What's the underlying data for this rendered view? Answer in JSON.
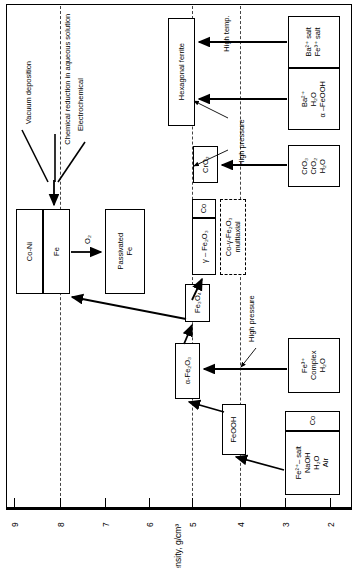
{
  "figure": {
    "axis_title": "Bulk density, g/cm³",
    "tick_labels": [
      "9",
      "8",
      "7",
      "6",
      "5",
      "4",
      "3",
      "2"
    ],
    "dashed_guides": [
      "8",
      "5",
      "4"
    ]
  },
  "process_labels": {
    "vacuum_deposition": "Vacuum deposition",
    "chemical_reduction": "Chemical reduction in aqueous solution",
    "electrochemical": "Electrochemical",
    "oxygen": "O₂",
    "high_temp": "High temp.",
    "high_pressure_upper": "High pressure",
    "high_pressure_lower": "High pressure"
  },
  "boxes": {
    "co_ni": "Co-Ni",
    "fe": "Fe",
    "passivated_fe_l1": "Passivated",
    "passivated_fe_l2": "Fe",
    "hexagonal_ferrite": "Hexagonal ferrite",
    "ba_fe_salt_l1": "Ba²⁺ salt",
    "ba_fe_salt_l2": "Fe³⁺ salt",
    "ba_feooh_l1": "Ba²⁺",
    "ba_feooh_l2": "H₂O",
    "ba_feooh_l3": "α –FeOOH",
    "cro2_product": "CrO₂",
    "cro3_src_l1": "CrO₃",
    "cro3_src_l2": "CrO₂",
    "cro3_src_l3": "H₂O",
    "gamma_fe2o3": "γ – Fe₂O₃",
    "co_coat": "Co",
    "co_gamma_multiaxial_l1": "Co-γ-Fe₂O₃",
    "co_gamma_multiaxial_l2": "multiaxial",
    "fe3o4": "Fe₃O₄",
    "alpha_fe2o3": "α-Fe₂O₃",
    "feooh": "FeOOH",
    "fe3_complex_l1": "Fe³⁺",
    "fe3_complex_l2": "Complex",
    "fe3_complex_l3": "H₂O",
    "fe2_salt_l1": "Fe²⁺– salt",
    "fe2_salt_l2": "NaOH",
    "fe2_salt_l3": "H₂O",
    "fe2_salt_l4": "Air",
    "co_bottom": "Co"
  }
}
